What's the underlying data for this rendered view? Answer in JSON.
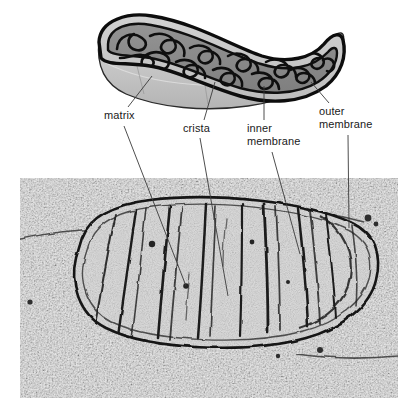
{
  "figure": {
    "width": 418,
    "height": 420,
    "background": "#ffffff"
  },
  "labels": [
    {
      "id": "matrix",
      "text": "matrix",
      "line1": "matrix",
      "line2": "",
      "x": 104,
      "y": 109,
      "leader_to_schematic": {
        "x1": 128,
        "y1": 107,
        "x2": 152,
        "y2": 76
      },
      "leader_to_micrograph": {
        "x1": 124,
        "y1": 126,
        "x2": 186,
        "y2": 286
      }
    },
    {
      "id": "crista",
      "text": "crista",
      "line1": "crista",
      "line2": "",
      "x": 183,
      "y": 122,
      "leader_to_schematic": {
        "x1": 204,
        "y1": 120,
        "x2": 215,
        "y2": 82
      },
      "leader_to_micrograph": {
        "x1": 200,
        "y1": 138,
        "x2": 228,
        "y2": 296
      }
    },
    {
      "id": "inner-membrane",
      "text": "inner membrane",
      "line1": "inner",
      "line2": "membrane",
      "x": 247,
      "y": 122,
      "leader_to_schematic": {
        "x1": 264,
        "y1": 120,
        "x2": 264,
        "y2": 86
      },
      "leader_to_micrograph": {
        "x1": 272,
        "y1": 152,
        "x2": 300,
        "y2": 254
      }
    },
    {
      "id": "outer-membrane",
      "text": "outer membrane",
      "line1": "outer",
      "line2": "membrane",
      "x": 319,
      "y": 105,
      "leader_to_schematic": {
        "x1": 329,
        "y1": 103,
        "x2": 311,
        "y2": 82
      },
      "leader_to_micrograph": {
        "x1": 348,
        "y1": 135,
        "x2": 349,
        "y2": 228
      }
    }
  ],
  "schematic": {
    "name": "mitochondrion-cutaway-3d",
    "description": "Three-dimensional cutaway drawing of a mitochondrion showing outer membrane, inner membrane, cristae folds and matrix",
    "colors": {
      "outer_body": "#c9c9c9",
      "outer_body_shadow": "#b0b0b0",
      "outer_body_highlight": "#dcdcdc",
      "matrix": "#8d8d8d",
      "cut_face": "#a8a8a8",
      "membrane_stroke": "#111111"
    }
  },
  "micrograph": {
    "name": "mitochondrion-electron-micrograph",
    "description": "Transmission electron micrograph of a mitochondrion in cross-section with dark cristae and granular cytoplasm",
    "frame": {
      "x": 20,
      "y": 178,
      "width": 378,
      "height": 220
    },
    "colors": {
      "cytoplasm_light": "#e6e6e6",
      "cytoplasm_mid": "#bdbdbd",
      "granule_dark": "#3a3a3a",
      "matrix": "#cfcfcf",
      "membrane": "#1b1b1b"
    }
  }
}
